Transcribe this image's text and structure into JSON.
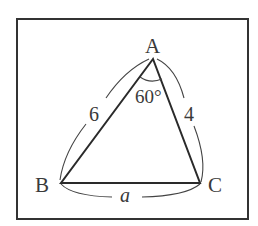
{
  "diagram": {
    "type": "triangle",
    "vertices": {
      "A": {
        "label": "A",
        "x": 153,
        "y": 59
      },
      "B": {
        "label": "B",
        "x": 61,
        "y": 183
      },
      "C": {
        "label": "C",
        "x": 200,
        "y": 183
      }
    },
    "sides": {
      "AB": {
        "label": "6"
      },
      "AC": {
        "label": "4"
      },
      "BC": {
        "label": "a"
      }
    },
    "angle_A": {
      "label": "60°"
    }
  },
  "colors": {
    "stroke": "#2a2a2a",
    "frame": "#333333",
    "background": "#ffffff"
  }
}
